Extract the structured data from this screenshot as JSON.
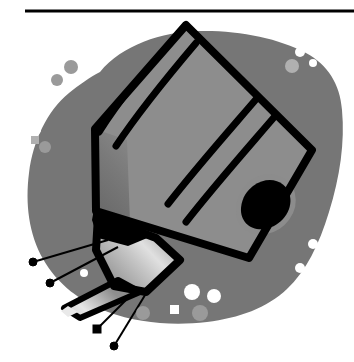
{
  "page": {
    "width": 354,
    "height": 362,
    "background_color": "#ffffff",
    "type": "grayscale-line-illustration"
  },
  "rule": {
    "name": "top-horizontal-rule",
    "x1": 25,
    "y1": 11,
    "x2": 354,
    "y2": 11,
    "thickness": 3,
    "color": "#000000"
  },
  "palette": {
    "outline": "#000000",
    "blob_gray": "#767676",
    "blob_speckle_light": "#ffffff",
    "blob_speckle_mid": "#9a9a9a",
    "body_dark": "#6e6e6e",
    "body_mid": "#8f8f8f",
    "body_light": "#b4b4b4",
    "body_highlight": "#d9d9d9",
    "body_bright": "#ececec",
    "nozzle_light": "#c9c9c9",
    "nozzle_shadow": "#5a5a5a",
    "paper_white": "#ffffff"
  },
  "figure": {
    "alt": "Grayscale clip-art of an angled cylindrical device body with banded shading, two dark bands around the barrel, a dark capsule-shaped detail at the lower right of the barrel, and a tapered conical nozzle with a tube at the lower left. The device rests on an irregular gray blob with lighter speckles. Four thin leader lines with dot terminators point to parts of the nozzle.",
    "background_blob": {
      "name": "background-blob",
      "fill": "#767676",
      "path": "M 98 74 C 120 46, 160 33, 196 32 C 236 31, 276 38, 304 52 C 326 63, 338 82, 340 108 C 343 140, 339 175, 328 210 C 318 243, 305 270, 286 288 C 266 307, 238 317, 206 321 C 172 325, 137 322, 107 311 C 80 301, 56 283, 42 258 C 28 233, 24 203, 28 172 C 32 140, 46 110, 68 92 C 78 84, 88 78, 98 74 Z"
    },
    "speckles": [
      {
        "name": "speckle-dot",
        "cx": 44,
        "cy": 92,
        "rx": 7,
        "ry": 7,
        "fill": "#ffffff"
      },
      {
        "name": "speckle-dot",
        "cx": 36,
        "cy": 130,
        "rx": 5,
        "ry": 5,
        "fill": "#ffffff"
      },
      {
        "name": "speckle-dot",
        "cx": 57,
        "cy": 80,
        "rx": 6,
        "ry": 6,
        "fill": "#9a9a9a"
      },
      {
        "name": "speckle-dot",
        "cx": 70,
        "cy": 68,
        "rx": 7,
        "ry": 7,
        "fill": "#9a9a9a"
      },
      {
        "name": "speckle-square",
        "cx": 35,
        "cy": 140,
        "rx": 4,
        "ry": 4,
        "fill": "#b0b0b0",
        "shape": "square"
      },
      {
        "name": "speckle-dot",
        "cx": 44,
        "cy": 147,
        "rx": 6,
        "ry": 6,
        "fill": "#9a9a9a"
      },
      {
        "name": "speckle-dot",
        "cx": 300,
        "cy": 52,
        "rx": 5,
        "ry": 5,
        "fill": "#ffffff"
      },
      {
        "name": "speckle-dot",
        "cx": 312,
        "cy": 62,
        "rx": 4,
        "ry": 4,
        "fill": "#ffffff"
      },
      {
        "name": "speckle-dot",
        "cx": 293,
        "cy": 66,
        "rx": 7,
        "ry": 7,
        "fill": "#b0b0b0"
      },
      {
        "name": "speckle-dot",
        "cx": 313,
        "cy": 244,
        "rx": 5,
        "ry": 5,
        "fill": "#ffffff"
      },
      {
        "name": "speckle-dot",
        "cx": 300,
        "cy": 268,
        "rx": 5,
        "ry": 5,
        "fill": "#ffffff"
      },
      {
        "name": "speckle-dot",
        "cx": 40,
        "cy": 278,
        "rx": 5,
        "ry": 5,
        "fill": "#ffffff"
      },
      {
        "name": "speckle-dot",
        "cx": 34,
        "cy": 292,
        "rx": 6,
        "ry": 6,
        "fill": "#ffffff"
      },
      {
        "name": "speckle-dot",
        "cx": 192,
        "cy": 292,
        "rx": 8,
        "ry": 8,
        "fill": "#ffffff"
      },
      {
        "name": "speckle-dot",
        "cx": 213,
        "cy": 296,
        "rx": 7,
        "ry": 7,
        "fill": "#ffffff"
      },
      {
        "name": "speckle-square",
        "cx": 174,
        "cy": 310,
        "rx": 5,
        "ry": 5,
        "fill": "#ffffff",
        "shape": "square"
      },
      {
        "name": "speckle-dot",
        "cx": 199,
        "cy": 313,
        "rx": 8,
        "ry": 8,
        "fill": "#9a9a9a"
      },
      {
        "name": "speckle-dot",
        "cx": 143,
        "cy": 313,
        "rx": 7,
        "ry": 7,
        "fill": "#9a9a9a"
      },
      {
        "name": "speckle-dot",
        "cx": 84,
        "cy": 273,
        "rx": 4,
        "ry": 4,
        "fill": "#ffffff"
      }
    ],
    "body": {
      "name": "device-barrel",
      "outline_color": "#000000",
      "outline_width": 7,
      "path": "M 186 24 L 311 148 L 247 259 L 93 212 L 93 130 Z"
    },
    "leader_lines": [
      {
        "name": "leader-line-1",
        "x1": 33,
        "y1": 262,
        "x2": 108,
        "y2": 240,
        "dot_r": 4
      },
      {
        "name": "leader-line-2",
        "x1": 50,
        "y1": 283,
        "x2": 118,
        "y2": 247,
        "dot_r": 4
      },
      {
        "name": "leader-line-3",
        "x1": 97,
        "y1": 329,
        "x2": 137,
        "y2": 289,
        "dot_r": 4
      },
      {
        "name": "leader-line-4",
        "x1": 114,
        "y1": 346,
        "x2": 153,
        "y2": 282,
        "dot_r": 4
      }
    ]
  },
  "labels": {
    "figure_role": "illustration",
    "rule_role": "separator"
  }
}
